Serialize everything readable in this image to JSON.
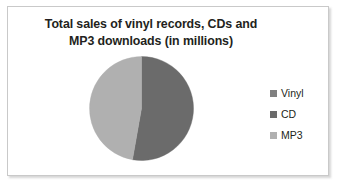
{
  "chart_data": {
    "type": "pie",
    "title": "Total sales of vinyl records, CDs and MP3 downloads (in millions)",
    "title_lines": [
      "Total sales of vinyl records, CDs and",
      "MP3 downloads (in millions)"
    ],
    "xlabel": "",
    "ylabel": "",
    "grid": false,
    "legend_position": "right",
    "data_labels_shown": false,
    "categories": [
      "Vinyl",
      "CD",
      "MP3"
    ],
    "values": [
      0,
      53,
      47
    ],
    "units": "millions",
    "slices": [
      {
        "label": "Vinyl",
        "value": 0,
        "percent": 0,
        "start_angle_deg": 0,
        "end_angle_deg": 0,
        "color": "#808080",
        "visible": false
      },
      {
        "label": "CD",
        "value": 53,
        "percent": 53,
        "start_angle_deg": 0,
        "end_angle_deg": 190,
        "color": "#6b6b6b",
        "visible": true
      },
      {
        "label": "MP3",
        "value": 47,
        "percent": 47,
        "start_angle_deg": 190,
        "end_angle_deg": 360,
        "color": "#b0b0b0",
        "visible": true
      }
    ],
    "legend": [
      {
        "label": "Vinyl",
        "color": "#808080"
      },
      {
        "label": "CD",
        "color": "#6b6b6b"
      },
      {
        "label": "MP3",
        "color": "#b0b0b0"
      }
    ]
  },
  "colors": {
    "vinyl": "#808080",
    "cd": "#6b6b6b",
    "mp3": "#b0b0b0",
    "title_text": "#231f20",
    "frame_border": "#c9c9c9",
    "background": "#ffffff"
  }
}
